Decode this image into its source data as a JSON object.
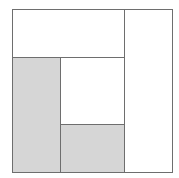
{
  "diagram": {
    "type": "rectangle-partition",
    "outer": {
      "x": 12,
      "y": 9,
      "w": 161,
      "h": 164
    },
    "line_color": "#6e6e6e",
    "regions": [
      {
        "id": "top",
        "x": 12,
        "y": 9,
        "w": 113,
        "h": 49,
        "fill": "#ffffff",
        "shaded": false
      },
      {
        "id": "right",
        "x": 124,
        "y": 9,
        "w": 49,
        "h": 164,
        "fill": "#ffffff",
        "shaded": false
      },
      {
        "id": "left",
        "x": 12,
        "y": 57,
        "w": 49,
        "h": 116,
        "fill": "#d6d6d6",
        "shaded": true
      },
      {
        "id": "middle",
        "x": 60,
        "y": 57,
        "w": 65,
        "h": 68,
        "fill": "#ffffff",
        "shaded": false
      },
      {
        "id": "bottom-middle",
        "x": 60,
        "y": 124,
        "w": 65,
        "h": 49,
        "fill": "#d6d6d6",
        "shaded": true
      }
    ]
  }
}
